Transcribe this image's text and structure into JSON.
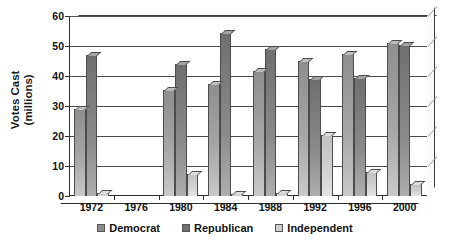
{
  "chart_data": {
    "type": "bar",
    "title": "",
    "subtitle": "",
    "xlabel": "",
    "ylabel": "Votes Cast (millions)",
    "ylabel_lines": [
      "Votes Cast",
      "(millions)"
    ],
    "categories": [
      "1972",
      "1976",
      "1980",
      "1984",
      "1988",
      "1992",
      "1996",
      "2000"
    ],
    "series": [
      {
        "name": "Democrat",
        "color": "#8e8e8e",
        "values": [
          29,
          0,
          35.5,
          37.5,
          41.8,
          44.9,
          47.4,
          51.0
        ]
      },
      {
        "name": "Republican",
        "color": "#6f6f6f",
        "values": [
          47,
          0,
          43.9,
          54.5,
          48.9,
          39.1,
          39.2,
          50.5
        ]
      },
      {
        "name": "Independent",
        "color": "#cfcfcf",
        "values": [
          1.1,
          0,
          7.5,
          0.6,
          0.9,
          20.3,
          8.1,
          4.0
        ]
      }
    ],
    "ylim": [
      0,
      60
    ],
    "yticks": [
      0,
      10,
      20,
      30,
      40,
      50,
      60
    ],
    "ytick_labels": [
      "0",
      "10",
      "20",
      "30",
      "40",
      "50",
      "60"
    ],
    "grid": true,
    "grid_axis": "y",
    "legend_position": "bottom",
    "style": "3d-column"
  },
  "legend": {
    "items": [
      {
        "label": "Democrat"
      },
      {
        "label": "Republican"
      },
      {
        "label": "Independent"
      }
    ]
  }
}
